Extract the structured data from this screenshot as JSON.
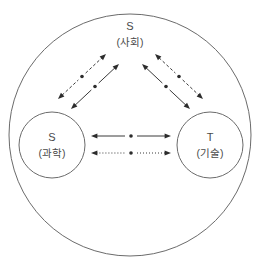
{
  "diagram": {
    "title_text": "",
    "outer_boundary": {
      "name": "society-boundary-circle",
      "cx": 130,
      "cy": 135,
      "r": 121,
      "stroke": "#6b6b6b"
    },
    "nodes": [
      {
        "id": "society",
        "label": "S",
        "sublabel": "(사회)",
        "label_x": 130,
        "label_y": 27,
        "sublabel_x": 130,
        "sublabel_y": 43,
        "has_circle": false
      },
      {
        "id": "science",
        "label": "S",
        "sublabel": "(과학)",
        "cx": 52,
        "cy": 145,
        "r": 33,
        "label_x": 52,
        "label_y": 138,
        "sublabel_x": 52,
        "sublabel_y": 154,
        "has_circle": true,
        "stroke": "#6b6b6b"
      },
      {
        "id": "technology",
        "label": "T",
        "sublabel": "(기술)",
        "cx": 210,
        "cy": 145,
        "r": 33,
        "label_x": 210,
        "label_y": 138,
        "sublabel_x": 210,
        "sublabel_y": 154,
        "has_circle": true,
        "stroke": "#6b6b6b"
      }
    ],
    "connectors": [
      {
        "id": "science-to-society-dashed",
        "style": "dashed",
        "x1": 58,
        "y1": 99,
        "x2": 106,
        "y2": 54,
        "dot_x": 82,
        "dot_y": 76.5,
        "gap": 5,
        "arrow_start": true,
        "arrow_end": true
      },
      {
        "id": "science-to-society-solid",
        "style": "solid",
        "x1": 71,
        "y1": 109,
        "x2": 119,
        "y2": 64,
        "dot_x": 95,
        "dot_y": 86.5,
        "gap": 5,
        "arrow_start": true,
        "arrow_end": true
      },
      {
        "id": "society-to-technology-dashed",
        "style": "dashed",
        "x1": 155,
        "y1": 54,
        "x2": 203,
        "y2": 99,
        "dot_x": 179,
        "dot_y": 76.5,
        "gap": 5,
        "arrow_start": true,
        "arrow_end": true
      },
      {
        "id": "society-to-technology-solid",
        "style": "solid",
        "x1": 142,
        "y1": 64,
        "x2": 190,
        "y2": 109,
        "dot_x": 166,
        "dot_y": 86.5,
        "gap": 5,
        "arrow_start": true,
        "arrow_end": true
      },
      {
        "id": "science-technology-solid",
        "style": "solid",
        "x1": 91,
        "y1": 136,
        "x2": 171,
        "y2": 136,
        "dot_x": 131,
        "dot_y": 136,
        "gap": 6,
        "arrow_start": true,
        "arrow_end": true
      },
      {
        "id": "science-technology-dotted",
        "style": "dotted",
        "x1": 91,
        "y1": 153,
        "x2": 171,
        "y2": 153,
        "dot_x": 131,
        "dot_y": 153,
        "gap": 6,
        "arrow_start": true,
        "arrow_end": true
      }
    ]
  }
}
